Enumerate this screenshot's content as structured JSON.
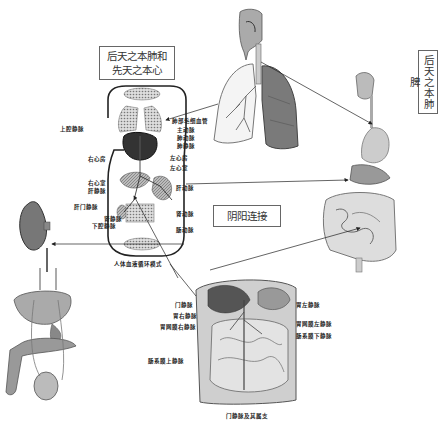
{
  "labels": {
    "box_lung_heart": "后天之本肺和先天之本心",
    "box_lung_heart_line1": "后天之本肺和",
    "box_lung_heart_line2": "先天之本心",
    "box_lung_spleen": "后天之本肺脾",
    "box_yinyang": "阴阳连接"
  },
  "circulation_diagram": {
    "caption": "人体血液循环模式",
    "left_labels": [
      "上腔静脉",
      "右心房",
      "右心室",
      "肝静脉",
      "肝门静脉",
      "肾静脉",
      "下腔静脉"
    ],
    "right_labels": [
      "肺部毛细血管",
      "主动脉",
      "肺动脉",
      "肺静脉",
      "左心房",
      "左心室",
      "肝动脉",
      "肾动脉",
      "肠动脉"
    ]
  },
  "portal_diagram": {
    "caption": "门静脉及其属支",
    "left_labels": [
      "门静脉",
      "胃右静脉",
      "胃网膜右静脉",
      "肠系膜上静脉"
    ],
    "right_labels": [
      "胃左静脉",
      "胃网膜左静脉",
      "肠系膜下静脉"
    ]
  },
  "illustrations": [
    {
      "name": "respiratory-system",
      "description": "head, trachea and lungs"
    },
    {
      "name": "digestive-system",
      "description": "mouth, esophagus, stomach, intestines"
    },
    {
      "name": "kidney",
      "description": "kidney"
    },
    {
      "name": "reproductive-urinary-organs",
      "description": "bladder, prostate, testis"
    },
    {
      "name": "abdominal-cavity",
      "description": "portal vein dissection"
    }
  ],
  "colors": {
    "line": "#222222",
    "box_border": "#666666",
    "organ_dark": "#555555",
    "organ_mid": "#999999",
    "organ_light": "#cccccc"
  }
}
